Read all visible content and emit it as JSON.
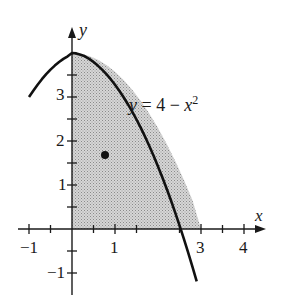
{
  "figure": {
    "curve_label": {
      "y": "y",
      "eq": " = 4 − ",
      "x": "x",
      "exp": "2"
    },
    "axis_labels": {
      "x": "x",
      "y": "y"
    },
    "x_ticks": [
      {
        "value": -1,
        "label": "−1"
      },
      {
        "value": 1,
        "label": "1"
      },
      {
        "value": 3,
        "label": "3"
      },
      {
        "value": 4,
        "label": "4"
      }
    ],
    "y_ticks": [
      {
        "value": 3,
        "label": "3"
      },
      {
        "value": 2,
        "label": "2"
      },
      {
        "value": 1,
        "label": "1"
      },
      {
        "value": -1,
        "label": "−1"
      }
    ],
    "function": "y = 4 - x^2",
    "shaded_region": {
      "x_from": 0,
      "x_to": 2,
      "description": "region under y = 4 - x^2 in first quadrant"
    },
    "point": {
      "x": 0.77,
      "y": 1.68
    },
    "domain_drawn": [
      -1,
      2.25
    ]
  }
}
